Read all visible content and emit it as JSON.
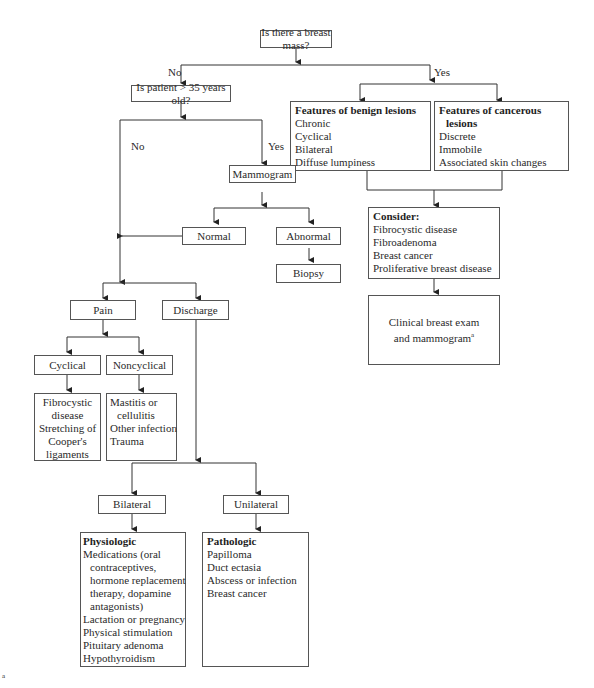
{
  "diagram": {
    "root": {
      "label": "Is there a breast mass?"
    },
    "branch_no_label": "No",
    "branch_yes_label": "Yes",
    "age_question": {
      "label": "Is patient > 35 years old?"
    },
    "age_no_label": "No",
    "age_yes_label": "Yes",
    "mammogram": {
      "label": "Mammogram"
    },
    "normal": {
      "label": "Normal"
    },
    "abnormal": {
      "label": "Abnormal"
    },
    "biopsy": {
      "label": "Biopsy"
    },
    "benign": {
      "title": "Features of benign lesions",
      "items": [
        "Chronic",
        "Cyclical",
        "Bilateral",
        "Diffuse lumpiness"
      ]
    },
    "cancerous": {
      "title_line1": "Features of cancerous",
      "title_line2": "lesions",
      "items": [
        "Discrete",
        "Immobile",
        "Associated skin changes"
      ]
    },
    "consider": {
      "title": "Consider:",
      "items": [
        "Fibrocystic disease",
        "Fibroadenoma",
        "Breast cancer",
        "Proliferative breast disease"
      ]
    },
    "clinical": {
      "line1": "Clinical breast exam",
      "line2": "and mammogram",
      "sup": "a"
    },
    "pain": {
      "label": "Pain"
    },
    "discharge": {
      "label": "Discharge"
    },
    "cyclical": {
      "label": "Cyclical"
    },
    "noncyclical": {
      "label": "Noncyclical"
    },
    "cyclical_causes": {
      "lines": [
        "Fibrocystic",
        "disease",
        "Stretching of",
        "Cooper's",
        "ligaments"
      ]
    },
    "noncyclical_causes": {
      "lines": [
        "Mastitis or",
        "cellulitis",
        "Other infection",
        "Trauma"
      ]
    },
    "bilateral": {
      "label": "Bilateral"
    },
    "unilateral": {
      "label": "Unilateral"
    },
    "physiologic": {
      "title": "Physiologic",
      "lines": [
        "Medications (oral",
        "contraceptives,",
        "hormone replacement",
        "therapy, dopamine",
        "antagonists)",
        "Lactation or pregnancy",
        "Physical stimulation",
        "Pituitary adenoma",
        "Hypothyroidism"
      ]
    },
    "pathologic": {
      "title": "Pathologic",
      "items": [
        "Papilloma",
        "Duct ectasia",
        "Abscess or infection",
        "Breast cancer"
      ]
    },
    "footnote_marker": "a"
  }
}
